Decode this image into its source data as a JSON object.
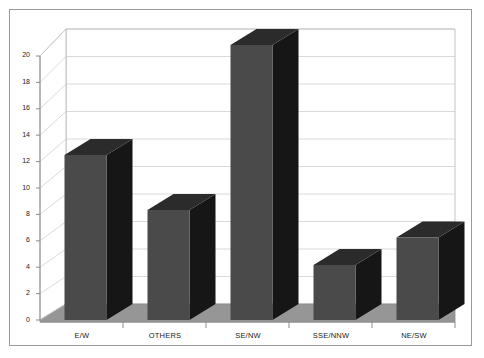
{
  "chart_data": {
    "type": "bar",
    "title": "",
    "subtitle": "",
    "xlabel": "",
    "ylabel": "",
    "categories": [
      "E/W",
      "OTHERS",
      "SE/NW",
      "SSE/NNW",
      "NE/SW"
    ],
    "values": [
      12,
      8,
      20,
      4,
      6
    ],
    "series": [
      {
        "name": "Count",
        "values": [
          12,
          8,
          20,
          4,
          6
        ]
      }
    ],
    "ylim": [
      0,
      20
    ],
    "yticks": [
      0,
      2,
      4,
      6,
      8,
      10,
      12,
      14,
      16,
      18,
      20
    ],
    "ytick_labels": [
      "0",
      "2",
      "4",
      "6",
      "8",
      "10",
      "12",
      "14",
      "16",
      "18",
      "20"
    ],
    "grid": true,
    "grid_axis": "y",
    "legend": false,
    "legend_position": "none",
    "three_d": true,
    "annotations": []
  },
  "style": {
    "page_background": "#ffffff",
    "border_color": "#9a9a9a",
    "plot_wall_color": "#ffffff",
    "plot_floor_color": "#969696",
    "gridline_color": "#c8c8c8",
    "axis_line_color": "#8c8c8c",
    "bar_front_color": "#4a4a4a",
    "bar_side_color": "#161616",
    "bar_top_color": "#2b2b2b",
    "tick_text_color": "#1a1a1a"
  },
  "axes": {
    "y_axis_name": "value-axis",
    "x_axis_name": "category-axis"
  }
}
